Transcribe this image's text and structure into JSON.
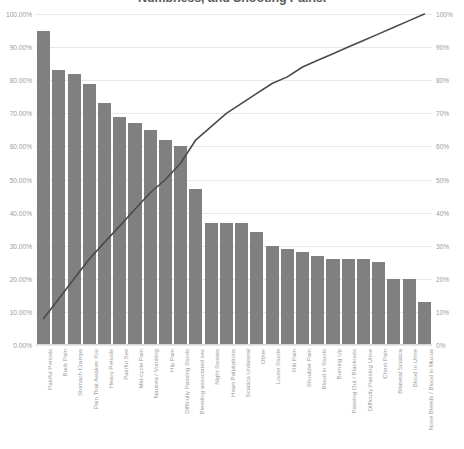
{
  "chart_data": {
    "type": "bar",
    "title": "Numbness, and Shooting Pains.",
    "xlabel": "",
    "ylabel": "",
    "ylim": [
      0,
      100
    ],
    "grid": true,
    "legend_position": "none",
    "secondary_axis": {
      "label": "",
      "ylim": [
        0,
        100
      ],
      "ticks": [
        "0%",
        "10%",
        "20%",
        "30%",
        "40%",
        "50%",
        "60%",
        "70%",
        "80%",
        "90%",
        "100%"
      ]
    },
    "primary_axis": {
      "ticks": [
        "0.00%",
        "10.00%",
        "20.00%",
        "30.00%",
        "40.00%",
        "50.00%",
        "60.00%",
        "70.00%",
        "80.00%",
        "90.00%",
        "100.00%"
      ]
    },
    "categories": [
      "Painful Periods",
      "Back Pain",
      "Stomach Cramps",
      "Pain That Awakes You",
      "Heavy Periods",
      "Painful Sex",
      "Mid-cycle Pain",
      "Nausea / Vomiting",
      "Hip Pain",
      "Difficulty Passing Stools",
      "Bleeding associated sex",
      "Night Sweats",
      "Heart Palpitations",
      "Sciatica Unilateral",
      "Other",
      "Loose Stools",
      "Rib Pain",
      "Shoulder Pain",
      "Blood in Stools",
      "Burning Up",
      "Passing Out / Blackouts",
      "Difficulty Passing Urine",
      "Chest Pain",
      "Bilateral Sciatica",
      "Blood in Urine",
      "Nose Bleeds / Blood in Mucus"
    ],
    "series": [
      {
        "name": "Frequency",
        "type": "bar",
        "color": "#808080",
        "values": [
          95,
          83,
          82,
          79,
          73,
          69,
          67,
          65,
          62,
          60,
          47,
          37,
          37,
          37,
          34,
          30,
          29,
          28,
          27,
          26,
          26,
          26,
          25,
          20,
          20,
          13
        ]
      },
      {
        "name": "Cumulative %",
        "type": "line",
        "color": "#4a4a4a",
        "values": [
          8,
          14,
          20,
          26,
          31,
          36,
          41,
          46,
          50,
          55,
          62,
          66,
          70,
          73,
          76,
          79,
          81,
          84,
          86,
          88,
          90,
          92,
          94,
          96,
          98,
          100
        ]
      }
    ]
  }
}
